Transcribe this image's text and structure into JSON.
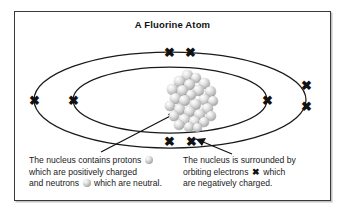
{
  "figure": {
    "title": "A Fluorine Atom",
    "border_color": "#3a3a3a",
    "background_color": "#ffffff"
  },
  "diagram": {
    "type": "bohr-atom-model",
    "element": "Fluorine",
    "nucleus": {
      "label": "nucleus",
      "nucleon_count": 28,
      "color": "#bdbdbd"
    },
    "shells": [
      {
        "name": "inner-orbit",
        "electron_count": 2
      },
      {
        "name": "outer-orbit",
        "electron_count": 7
      }
    ],
    "electron_glyph": "✖",
    "electron_color": "#111111",
    "orbit_color": "#1a1a1a"
  },
  "captions": {
    "left": {
      "name": "nucleus-caption",
      "line1_a": "The nucleus contains protons",
      "line1_b": "",
      "line2": "which are positively charged",
      "line3_a": "and neutrons",
      "line3_b": "which are neutral."
    },
    "right": {
      "name": "electron-caption",
      "line1": "The nucleus is surrounded by",
      "line2_a": "orbiting electrons",
      "line2_b": "which",
      "line3": "are negatively charged."
    }
  },
  "annotations": {
    "arrow_to_nucleus": "pointer-line-to-nucleus",
    "arrow_to_electrons": "pointer-line-to-electrons"
  }
}
